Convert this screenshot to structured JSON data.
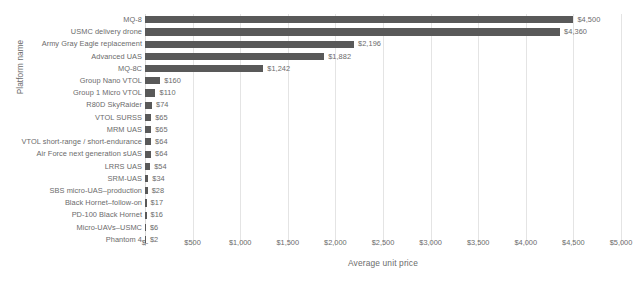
{
  "chart_data": {
    "type": "bar",
    "orientation": "horizontal",
    "title": "",
    "xlabel": "Average unit price",
    "ylabel": "Platform name",
    "xlim": [
      0,
      5000
    ],
    "grid": true,
    "legend": false,
    "categories": [
      "MQ-8",
      "USMC delivery drone",
      "Army Gray Eagle replacement",
      "Advanced UAS",
      "MQ-8C",
      "Group Nano VTOL",
      "Group 1 Micro VTOL",
      "R80D SkyRaider",
      "VTOL SURSS",
      "MRM UAS",
      "VTOL short-range / short-endurance",
      "Air Force next generation sUAS",
      "LRRS UAS",
      "SRM-UAS",
      "SBS micro-UAS–production",
      "Black Hornet–follow-on",
      "PD-100 Black Hornet",
      "Micro-UAVs–USMC",
      "Phantom 4"
    ],
    "values": [
      4500,
      4360,
      2196,
      1882,
      1242,
      160,
      110,
      74,
      65,
      65,
      64,
      64,
      54,
      34,
      28,
      17,
      16,
      6,
      2
    ],
    "value_labels": [
      "$4,500",
      "$4,360",
      "$2,196",
      "$1,882",
      "$1,242",
      "$160",
      "$110",
      "$74",
      "$65",
      "$65",
      "$64",
      "$64",
      "$54",
      "$34",
      "$28",
      "$17",
      "$16",
      "$6",
      "$2"
    ],
    "xticks": [
      0,
      500,
      1000,
      1500,
      2000,
      2500,
      3000,
      3500,
      4000,
      4500,
      5000
    ],
    "xticklabels": [
      "$-",
      "$500",
      "$1,000",
      "$1,500",
      "$2,000",
      "$2,500",
      "$3,000",
      "$3,500",
      "$4,000",
      "$4,500",
      "$5,000"
    ],
    "bar_color": "#595959",
    "grid_color": "#e4e4e4",
    "text_color": "#6b6b6b"
  }
}
